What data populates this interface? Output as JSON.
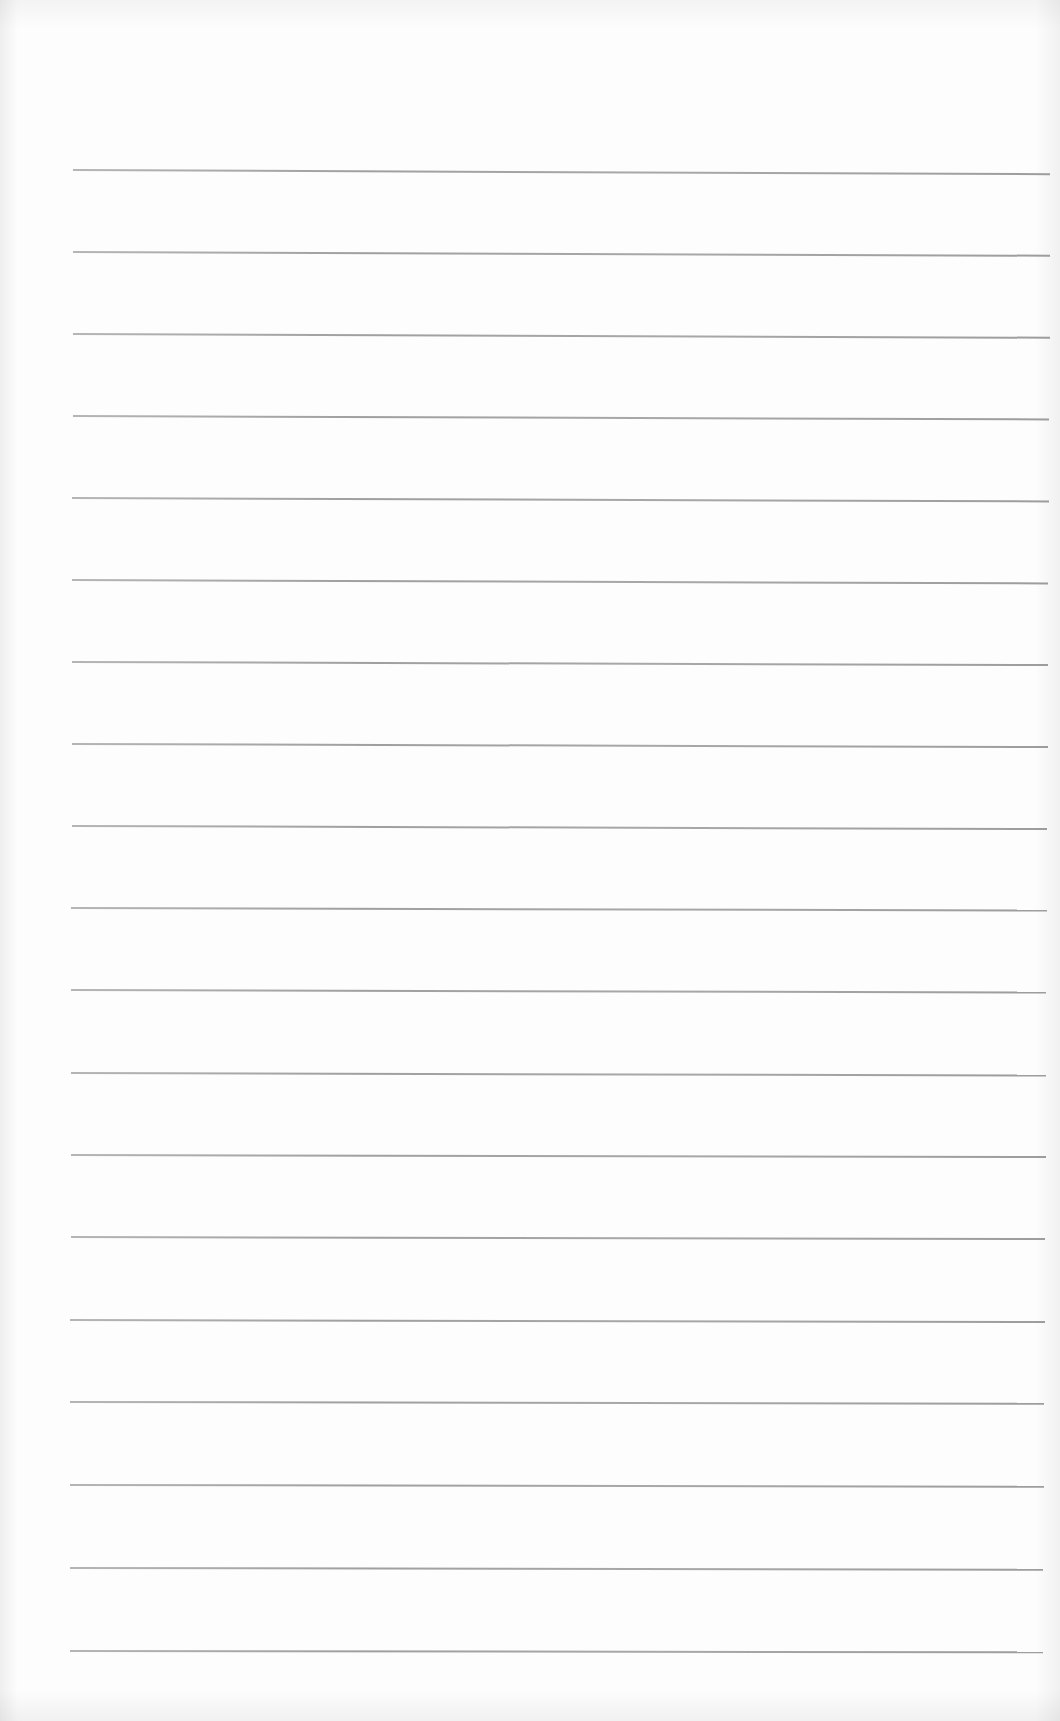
{
  "document": {
    "type": "ruled-paper",
    "background_color": "#fdfdfd",
    "line_color": "#959595",
    "line_thickness_px": 2,
    "rules": [
      {
        "y": 169,
        "x_start": 73,
        "x_end": 1050,
        "tilt_deg": 0.25
      },
      {
        "y": 251,
        "x_start": 73,
        "x_end": 1050,
        "tilt_deg": 0.22
      },
      {
        "y": 333,
        "x_start": 73,
        "x_end": 1050,
        "tilt_deg": 0.22
      },
      {
        "y": 415,
        "x_start": 73,
        "x_end": 1049,
        "tilt_deg": 0.2
      },
      {
        "y": 497,
        "x_start": 72,
        "x_end": 1049,
        "tilt_deg": 0.2
      },
      {
        "y": 579,
        "x_start": 72,
        "x_end": 1048,
        "tilt_deg": 0.2
      },
      {
        "y": 661,
        "x_start": 72,
        "x_end": 1048,
        "tilt_deg": 0.18
      },
      {
        "y": 743,
        "x_start": 72,
        "x_end": 1048,
        "tilt_deg": 0.18
      },
      {
        "y": 825,
        "x_start": 72,
        "x_end": 1047,
        "tilt_deg": 0.18
      },
      {
        "y": 907,
        "x_start": 71,
        "x_end": 1047,
        "tilt_deg": 0.15
      },
      {
        "y": 989,
        "x_start": 71,
        "x_end": 1046,
        "tilt_deg": 0.15
      },
      {
        "y": 1072,
        "x_start": 71,
        "x_end": 1046,
        "tilt_deg": 0.15
      },
      {
        "y": 1154,
        "x_start": 71,
        "x_end": 1046,
        "tilt_deg": 0.12
      },
      {
        "y": 1236,
        "x_start": 71,
        "x_end": 1045,
        "tilt_deg": 0.12
      },
      {
        "y": 1319,
        "x_start": 70,
        "x_end": 1045,
        "tilt_deg": 0.12
      },
      {
        "y": 1401,
        "x_start": 70,
        "x_end": 1044,
        "tilt_deg": 0.1
      },
      {
        "y": 1484,
        "x_start": 70,
        "x_end": 1044,
        "tilt_deg": 0.1
      },
      {
        "y": 1567,
        "x_start": 70,
        "x_end": 1043,
        "tilt_deg": 0.1
      },
      {
        "y": 1650,
        "x_start": 70,
        "x_end": 1043,
        "tilt_deg": 0.08
      }
    ],
    "text_content": []
  }
}
